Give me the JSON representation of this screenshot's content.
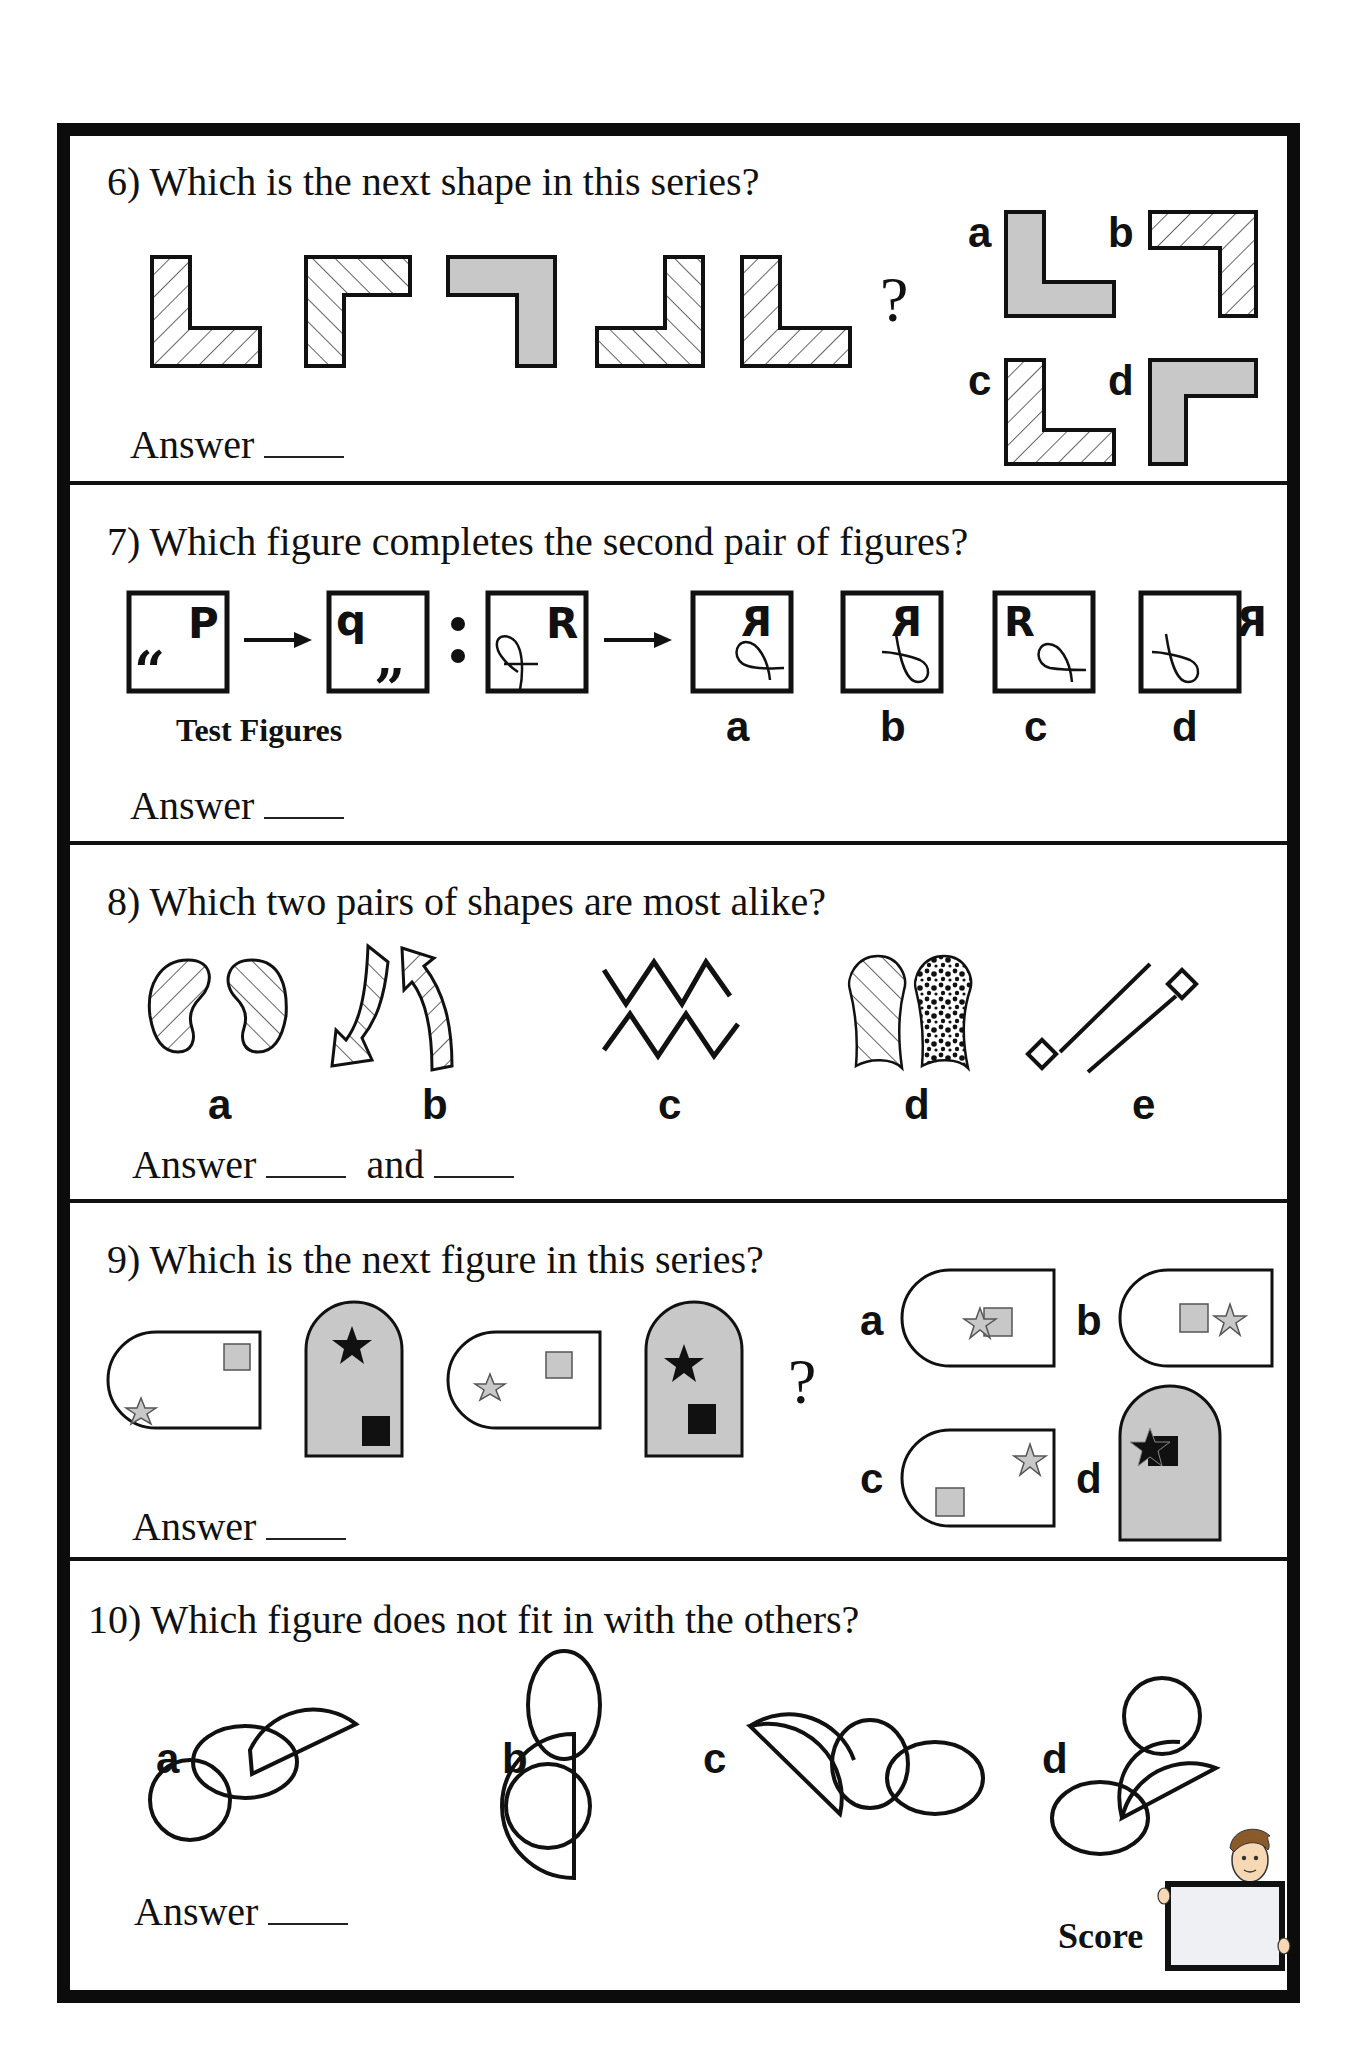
{
  "worksheet": {
    "questions": [
      {
        "number": "6)",
        "title": "6) Which is the next shape in this series?",
        "series_note": "Sequence of L-shaped figures with hatching or gray fill",
        "question_mark": "?",
        "options": [
          "a",
          "b",
          "c",
          "d"
        ],
        "answer_label": "Answer"
      },
      {
        "number": "7)",
        "title": "7) Which figure completes the second pair of figures?",
        "test_figures_label": "Test Figures",
        "test_glyphs": [
          "P",
          "q",
          "R"
        ],
        "option_glyphs": [
          "Я",
          "Я",
          "R",
          "Я"
        ],
        "options": [
          "a",
          "b",
          "c",
          "d"
        ],
        "answer_label": "Answer"
      },
      {
        "number": "8)",
        "title": "8) Which two pairs of shapes are most alike?",
        "options": [
          "a",
          "b",
          "c",
          "d",
          "e"
        ],
        "answer_label": "Answer",
        "and_label": "and"
      },
      {
        "number": "9)",
        "title": "9) Which is the next figure in this series?",
        "question_mark": "?",
        "options": [
          "a",
          "b",
          "c",
          "d"
        ],
        "answer_label": "Answer"
      },
      {
        "number": "10)",
        "title": "10) Which figure does not fit in with the others?",
        "options": [
          "a",
          "b",
          "c",
          "d"
        ],
        "answer_label": "Answer"
      }
    ],
    "score_label": "Score"
  },
  "colors": {
    "border": "#0c0c0c",
    "gray_fill": "#c8c8c8",
    "score_board": "#eef0f4",
    "hair": "#8a5a2b",
    "skin": "#f6d9b4"
  }
}
